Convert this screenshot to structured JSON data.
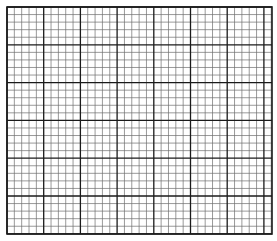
{
  "graph_paper": {
    "background": "#ffffff",
    "line_color_major": "#1a1a1a",
    "line_color_minor": "#6e6e6e",
    "major_stroke_width": 1.3,
    "minor_stroke_width": 0.7,
    "border_stroke_width": 1.6,
    "origin_x": 7,
    "origin_y": 7,
    "end_x": 272,
    "end_y": 234,
    "major_spacing_x": 36.7,
    "major_spacing_y": 37.8,
    "minor_divisions": 5
  }
}
